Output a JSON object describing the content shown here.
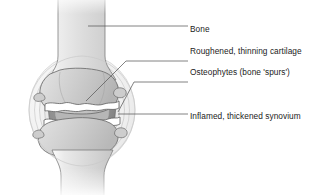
{
  "figure": {
    "background_color": "#ffffff"
  },
  "labels": [
    {
      "id": "bone",
      "text": "Bone"
    },
    {
      "id": "cartilage",
      "text": "Roughened, thinning cartilage"
    },
    {
      "id": "osteophytes",
      "text": "Osteophytes (bone 'spurs')"
    },
    {
      "id": "synovium",
      "text": "Inflamed, thickened synovium"
    }
  ],
  "colors": {
    "background": "#ffffff",
    "outline": "#6f6f6f",
    "leader_line": "#5a5a5a",
    "bone_light": "#f2f2f2",
    "bone_mid": "#d8d8d8",
    "bone_shade": "#bdbdbd",
    "synovium_dark": "#8f8f8f",
    "capsule_fill": "#e8e8e8",
    "capsule_ring": "#d2d2d2",
    "joint_space_white": "#ffffff",
    "text": "#1b1b1b"
  },
  "anatomy": {
    "parts": [
      {
        "name": "upper-bone-shaft",
        "description": "Femoral shaft descending from top of image"
      },
      {
        "name": "lower-bone-shaft",
        "description": "Tibial shaft descending to bottom of image"
      },
      {
        "name": "upper-bone-end",
        "description": "Widened condylar bone end above joint space"
      },
      {
        "name": "lower-bone-end",
        "description": "Widened bone end below joint space"
      },
      {
        "name": "joint-capsule",
        "description": "Concentric oval rings surrounding the joint"
      },
      {
        "name": "synovial-membrane",
        "description": "Thickened dark grey lining inside the capsule"
      },
      {
        "name": "cartilage-band",
        "description": "Irregular white bands at the articulating surfaces"
      },
      {
        "name": "osteophyte-spurs",
        "description": "Bony outgrowths at the joint margins"
      }
    ]
  }
}
